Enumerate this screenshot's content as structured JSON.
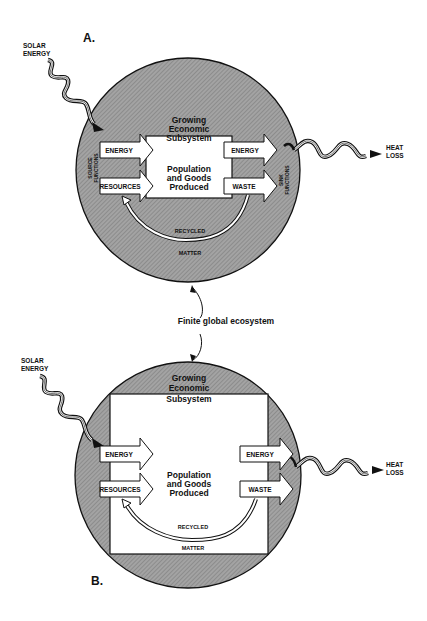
{
  "colors": {
    "ecosystem_fill": "#9a9a9a",
    "outline": "#111111",
    "subsystem_fill": "#ffffff"
  },
  "center_label": "Finite global ecosystem",
  "diagram_a": {
    "panel_label": "A.",
    "solar_label_1": "SOLAR",
    "solar_label_2": "ENERGY",
    "heat_label_1": "HEAT",
    "heat_label_2": "LOSS",
    "subsystem_title_1": "Growing",
    "subsystem_title_2": "Economic",
    "subsystem_title_3": "Subsystem",
    "subsystem_body_1": "Population",
    "subsystem_body_2": "and Goods",
    "subsystem_body_3": "Produced",
    "source_label_1": "SOURCE",
    "source_label_2": "FUNCTIONS",
    "sink_label_1": "SINK",
    "sink_label_2": "FUNCTIONS",
    "input_energy": "ENERGY",
    "input_resources": "RESOURCES",
    "output_energy": "ENERGY",
    "output_waste": "WASTE",
    "recycled_label": "RECYCLED",
    "matter_label": "MATTER"
  },
  "diagram_b": {
    "panel_label": "B.",
    "solar_label_1": "SOLAR",
    "solar_label_2": "ENERGY",
    "heat_label_1": "HEAT",
    "heat_label_2": "LOSS",
    "subsystem_title_1": "Growing",
    "subsystem_title_2": "Economic",
    "subsystem_title_3": "Subsystem",
    "subsystem_body_1": "Population",
    "subsystem_body_2": "and Goods",
    "subsystem_body_3": "Produced",
    "input_energy": "ENERGY",
    "input_resources": "RESOURCES",
    "output_energy": "ENERGY",
    "output_waste": "WASTE",
    "recycled_label": "RECYCLED",
    "matter_label": "MATTER"
  }
}
